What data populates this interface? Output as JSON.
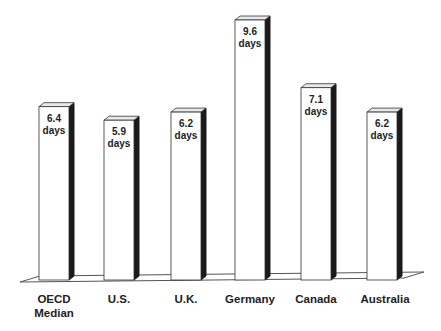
{
  "chart_data": {
    "type": "bar",
    "title": "",
    "xlabel": "",
    "ylabel": "",
    "categories": [
      "OECD Median",
      "U.S.",
      "U.K.",
      "Germany",
      "Canada",
      "Australia"
    ],
    "category_lines": [
      [
        "OECD",
        "Median"
      ],
      [
        "U.S."
      ],
      [
        "U.K."
      ],
      [
        "Germany"
      ],
      [
        "Canada"
      ],
      [
        "Australia"
      ]
    ],
    "values": [
      6.4,
      5.9,
      6.2,
      9.6,
      7.1,
      6.2
    ],
    "unit": "days",
    "data_labels": [
      [
        "6.4",
        "days"
      ],
      [
        "5.9",
        "days"
      ],
      [
        "6.2",
        "days"
      ],
      [
        "9.6",
        "days"
      ],
      [
        "7.1",
        "days"
      ],
      [
        "6.2",
        "days"
      ]
    ],
    "grid": false,
    "legend": null,
    "style": "3d",
    "ylim": [
      0,
      9.6
    ]
  },
  "colors": {
    "bar_front": "#ffffff",
    "bar_side": "#1a1a1a",
    "bar_outline": "#333333",
    "floor_line": "#555555"
  }
}
